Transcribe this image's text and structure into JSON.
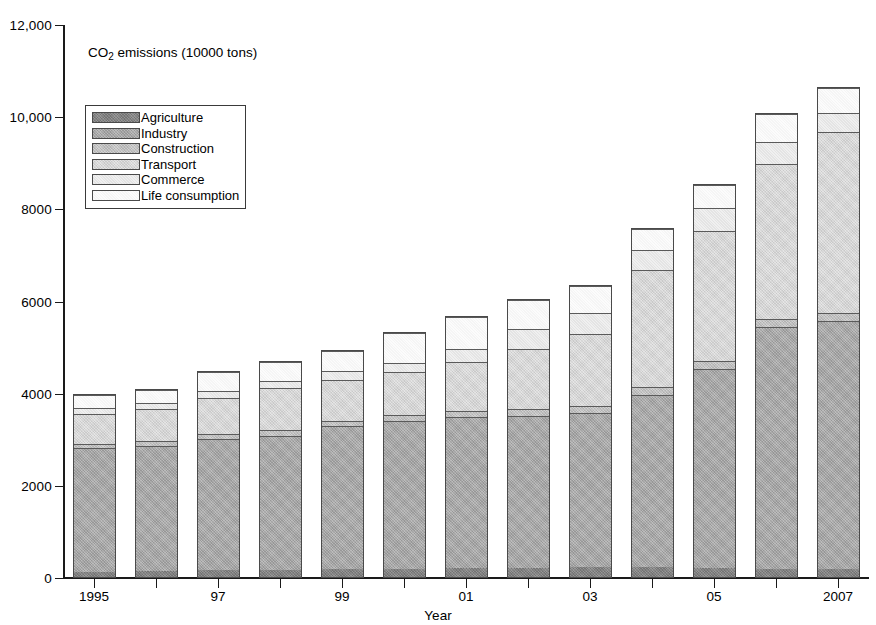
{
  "chart_data": {
    "type": "bar",
    "subtype": "stacked-bar",
    "title": "CO2 emissions (10000 tons)",
    "title_rich": {
      "pre": "CO",
      "sub": "2",
      "post": " emissions (10000 tons)"
    },
    "xlabel": "Year",
    "ylabel": "",
    "ylim": [
      0,
      12000
    ],
    "yticks": [
      0,
      2000,
      4000,
      6000,
      8000,
      10000,
      12000
    ],
    "ytick_labels": [
      "0",
      "2000",
      "4000",
      "6000",
      "8000",
      "10,000",
      "12,000"
    ],
    "grid": false,
    "legend_position": "upper-left-inside",
    "categories": [
      "1995",
      "1996",
      "1997",
      "1998",
      "1999",
      "2000",
      "2001",
      "2002",
      "2003",
      "2004",
      "2005",
      "2006",
      "2007"
    ],
    "xtick_labels": [
      "1995",
      "",
      "97",
      "",
      "99",
      "",
      "01",
      "",
      "03",
      "",
      "05",
      "",
      "2007"
    ],
    "series": [
      {
        "name": "Agriculture",
        "color": "#8a8a8a",
        "values": [
          120,
          130,
          150,
          160,
          170,
          180,
          190,
          200,
          210,
          220,
          200,
          180,
          170
        ]
      },
      {
        "name": "Industry",
        "color": "#b0b0b0",
        "values": [
          2700,
          2740,
          2870,
          2930,
          3130,
          3230,
          3300,
          3320,
          3380,
          3760,
          4330,
          5260,
          5400
        ]
      },
      {
        "name": "Construction",
        "color": "#c9c9c9",
        "values": [
          100,
          110,
          120,
          120,
          120,
          130,
          140,
          150,
          150,
          160,
          180,
          180,
          190
        ]
      },
      {
        "name": "Transport",
        "color": "#dedede",
        "values": [
          660,
          700,
          790,
          930,
          900,
          940,
          1080,
          1320,
          1570,
          2570,
          2830,
          3380,
          3930
        ]
      },
      {
        "name": "Commerce",
        "color": "#ededed",
        "values": [
          120,
          140,
          150,
          160,
          180,
          210,
          270,
          420,
          460,
          430,
          500,
          470,
          430
        ]
      },
      {
        "name": "Life consumption",
        "color": "#fbfbfb",
        "values": [
          300,
          280,
          420,
          400,
          450,
          640,
          700,
          650,
          580,
          460,
          510,
          610,
          530
        ]
      }
    ],
    "totals": [
      4000,
      4100,
      4500,
      4700,
      4950,
      5330,
      5680,
      6060,
      6350,
      7600,
      8550,
      10080,
      10650
    ]
  },
  "legend": {
    "items": [
      {
        "label": "Agriculture"
      },
      {
        "label": "Industry"
      },
      {
        "label": "Construction"
      },
      {
        "label": "Transport"
      },
      {
        "label": "Commerce"
      },
      {
        "label": "Life consumption"
      }
    ]
  }
}
